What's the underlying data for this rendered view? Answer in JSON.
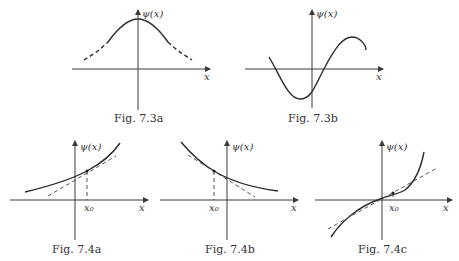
{
  "figures": [
    {
      "id": "7.3a",
      "caption": "Fig. 7.3a",
      "y_label": "ψ(x)",
      "x_label": "x",
      "description": "Bell-shaped curve, solid near peak, dashed tails"
    },
    {
      "id": "7.3b",
      "caption": "Fig. 7.3b",
      "y_label": "ψ(x)",
      "x_label": "x",
      "description": "Oscillating sine-like curve crossing x-axis twice"
    },
    {
      "id": "7.4a",
      "caption": "Fig. 7.4a",
      "y_label": "ψ(x)",
      "x_label": "x",
      "x0_label": "x₀",
      "description": "Increasing convex curve with dashed tangent at x0"
    },
    {
      "id": "7.4b",
      "caption": "Fig. 7.4b",
      "y_label": "ψ(x)",
      "x_label": "x",
      "x0_label": "x₀",
      "description": "Decreasing convex curve with dashed tangent at x0"
    },
    {
      "id": "7.4c",
      "caption": "Fig. 7.4c",
      "y_label": "ψ(x)",
      "x_label": "x",
      "x0_label": "x₀",
      "description": "Curve with inflection point near x0, dashed tangent"
    }
  ]
}
